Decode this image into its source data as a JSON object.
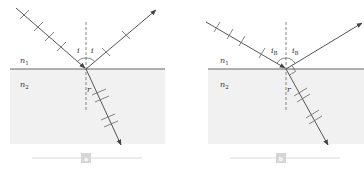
{
  "panels": [
    {
      "id": "a",
      "caption": "a",
      "medium_top": "n",
      "medium_top_sub": "1",
      "medium_bottom": "n",
      "medium_bottom_sub": "2",
      "incident_angle": "i",
      "incident_angle_sub": "",
      "reflected_angle": "i",
      "reflected_angle_sub": "",
      "refracted_angle": "r"
    },
    {
      "id": "b",
      "caption": "b",
      "medium_top": "n",
      "medium_top_sub": "1",
      "medium_bottom": "n",
      "medium_bottom_sub": "2",
      "incident_angle": "i",
      "incident_angle_sub": "B",
      "reflected_angle": "i",
      "reflected_angle_sub": "B",
      "refracted_angle": "r"
    }
  ],
  "colors": {
    "ray": "#555555",
    "interface": "#666666",
    "lower_medium": "#f1f1f1",
    "caption_box": "#d6d6d6",
    "caption_line": "#cfcfcf"
  }
}
